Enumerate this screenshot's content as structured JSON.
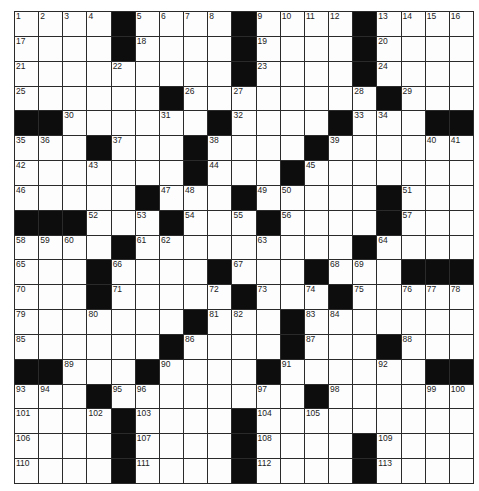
{
  "puzzle": {
    "rows": 19,
    "cols": 19,
    "legend": {
      "#": "black square",
      ".": "empty white square",
      "number": "numbered white square"
    },
    "grid": [
      [
        1,
        2,
        3,
        4,
        "#",
        5,
        6,
        7,
        8,
        "#",
        9,
        10,
        11,
        12,
        "#",
        13,
        14,
        15,
        16
      ],
      [
        17,
        ".",
        ".",
        ".",
        "#",
        18,
        ".",
        ".",
        ".",
        "#",
        19,
        ".",
        ".",
        ".",
        "#",
        20,
        ".",
        ".",
        "."
      ],
      [
        21,
        ".",
        ".",
        ".",
        22,
        ".",
        ".",
        ".",
        ".",
        "#",
        23,
        ".",
        ".",
        ".",
        "#",
        24,
        ".",
        ".",
        "."
      ],
      [
        25,
        ".",
        ".",
        ".",
        ".",
        ".",
        "#",
        26,
        ".",
        27,
        ".",
        ".",
        ".",
        ".",
        28,
        "#",
        29,
        ".",
        "."
      ],
      [
        "#",
        "#",
        30,
        ".",
        ".",
        ".",
        31,
        ".",
        "#",
        32,
        ".",
        ".",
        ".",
        "#",
        33,
        34,
        ".",
        "#",
        "#"
      ],
      [
        35,
        36,
        ".",
        "#",
        37,
        ".",
        ".",
        "#",
        38,
        ".",
        ".",
        ".",
        "#",
        39,
        ".",
        ".",
        ".",
        40,
        41
      ],
      [
        42,
        ".",
        ".",
        43,
        ".",
        ".",
        ".",
        "#",
        44,
        ".",
        ".",
        "#",
        45,
        ".",
        ".",
        ".",
        ".",
        ".",
        "."
      ],
      [
        46,
        ".",
        ".",
        ".",
        ".",
        "#",
        47,
        48,
        ".",
        "#",
        49,
        50,
        ".",
        ".",
        ".",
        "#",
        51,
        ".",
        "."
      ],
      [
        "#",
        "#",
        "#",
        52,
        ".",
        53,
        "#",
        54,
        ".",
        55,
        "#",
        56,
        ".",
        ".",
        ".",
        "#",
        57,
        ".",
        "."
      ],
      [
        58,
        59,
        60,
        ".",
        "#",
        61,
        62,
        ".",
        ".",
        ".",
        63,
        ".",
        ".",
        ".",
        "#",
        64,
        ".",
        ".",
        "."
      ],
      [
        65,
        ".",
        ".",
        "#",
        66,
        ".",
        ".",
        ".",
        "#",
        67,
        ".",
        ".",
        "#",
        68,
        69,
        ".",
        "#",
        "#",
        "#"
      ],
      [
        70,
        ".",
        ".",
        "#",
        71,
        ".",
        ".",
        ".",
        72,
        "#",
        73,
        ".",
        74,
        "#",
        75,
        ".",
        76,
        77,
        78
      ],
      [
        79,
        ".",
        ".",
        80,
        ".",
        ".",
        ".",
        "#",
        81,
        82,
        ".",
        "#",
        83,
        84,
        ".",
        ".",
        ".",
        ".",
        "."
      ],
      [
        85,
        ".",
        ".",
        ".",
        ".",
        ".",
        "#",
        86,
        ".",
        ".",
        ".",
        "#",
        87,
        ".",
        ".",
        "#",
        88,
        ".",
        "."
      ],
      [
        "#",
        "#",
        89,
        ".",
        ".",
        "#",
        90,
        ".",
        ".",
        ".",
        "#",
        91,
        ".",
        ".",
        ".",
        92,
        ".",
        "#",
        "#"
      ],
      [
        93,
        94,
        ".",
        "#",
        95,
        96,
        ".",
        ".",
        ".",
        ".",
        97,
        ".",
        "#",
        98,
        ".",
        ".",
        ".",
        99,
        100
      ],
      [
        101,
        ".",
        ".",
        102,
        "#",
        103,
        ".",
        ".",
        ".",
        "#",
        104,
        ".",
        105,
        ".",
        ".",
        ".",
        ".",
        ".",
        "."
      ],
      [
        106,
        ".",
        ".",
        ".",
        "#",
        107,
        ".",
        ".",
        ".",
        "#",
        108,
        ".",
        ".",
        ".",
        "#",
        109,
        ".",
        ".",
        "."
      ],
      [
        110,
        ".",
        ".",
        ".",
        "#",
        111,
        ".",
        ".",
        ".",
        "#",
        112,
        ".",
        ".",
        ".",
        "#",
        113,
        ".",
        ".",
        "."
      ]
    ],
    "colors": {
      "black_square": "#0d0d0d",
      "white_square": "#fdfdfd",
      "grid_line": "#2a2a2a"
    }
  }
}
